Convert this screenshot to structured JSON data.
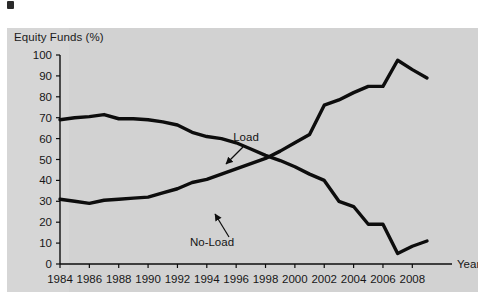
{
  "figure": {
    "background_color": "#ffffff",
    "panel_color": "#d2d2d2",
    "line_color": "#0d0d0d",
    "text_color": "#171717"
  },
  "chart_data": {
    "type": "line",
    "title": "",
    "subtitle": "",
    "ylabel": "Equity Funds (%)",
    "xlabel": "Year",
    "xlim": [
      1984,
      2009
    ],
    "ylim": [
      0,
      100
    ],
    "grid": false,
    "legend_position": "inline-annotations",
    "y_ticks": [
      0,
      10,
      20,
      30,
      40,
      50,
      60,
      70,
      80,
      90,
      100
    ],
    "y_tick_labels": [
      "0",
      "10",
      "20",
      "30",
      "40",
      "50",
      "60",
      "70",
      "80",
      "90",
      "100"
    ],
    "x_ticks": [
      1984,
      1986,
      1988,
      1990,
      1992,
      1994,
      1996,
      1998,
      2000,
      2002,
      2004,
      2006,
      2008
    ],
    "x_tick_labels": [
      "1984",
      "1986",
      "1988",
      "1990",
      "1992",
      "1994",
      "1996",
      "1998",
      "2000",
      "2002",
      "2004",
      "2006",
      "2008"
    ],
    "x": [
      1984,
      1985,
      1986,
      1987,
      1988,
      1989,
      1990,
      1991,
      1992,
      1993,
      1994,
      1995,
      1996,
      1997,
      1998,
      1999,
      2000,
      2001,
      2002,
      2003,
      2004,
      2005,
      2006,
      2007,
      2008,
      2009
    ],
    "series": [
      {
        "name": "Load",
        "values": [
          69,
          70,
          70.5,
          71.5,
          69.5,
          69.5,
          69,
          68,
          66.5,
          63,
          61,
          60,
          58,
          55,
          52,
          49.5,
          46.5,
          43,
          40,
          30,
          27.5,
          19,
          19,
          5,
          8.5,
          11
        ]
      },
      {
        "name": "No-Load",
        "values": [
          31,
          30,
          29,
          30.5,
          31,
          31.5,
          32,
          34,
          36,
          39,
          40.5,
          43,
          45.5,
          48,
          50.5,
          54,
          58,
          62,
          76,
          78.5,
          82,
          85,
          85,
          97.5,
          93,
          89
        ]
      }
    ],
    "annotations": [
      {
        "label": "Load",
        "text_x": 239,
        "text_y": 113,
        "arrow_from_x": 236,
        "arrow_from_y": 119,
        "arrow_to_x": 219,
        "arrow_to_y": 136
      },
      {
        "label": "No-Load",
        "text_x": 205,
        "text_y": 218,
        "arrow_from_x": 222,
        "arrow_from_y": 209,
        "arrow_to_x": 208,
        "arrow_to_y": 186
      }
    ]
  }
}
